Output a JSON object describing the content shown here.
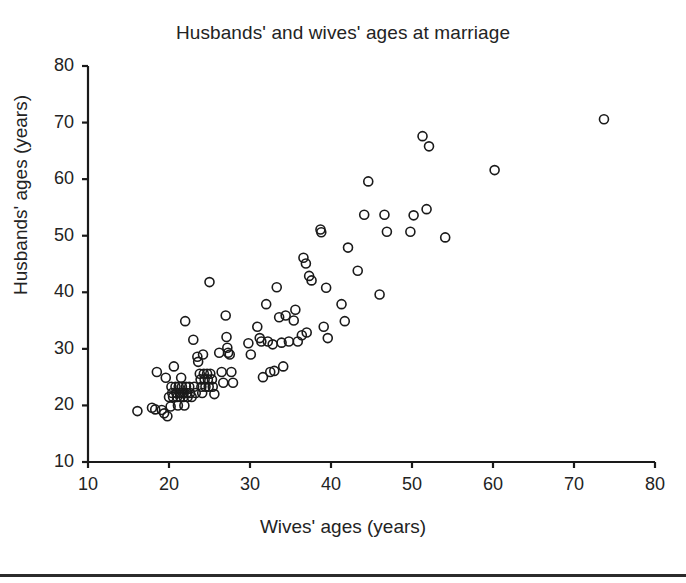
{
  "figure": {
    "title": "Husbands' and wives' ages at marriage",
    "background_color": "#ffffff",
    "axis_color": "#1a1a1a",
    "marker_color": "#1a1a1a",
    "bottom_rule_color": "#2b2b2b"
  },
  "axes": {
    "x_label": "Wives' ages (years)",
    "y_label": "Husbands' ages (years)",
    "x_ticks": [
      "10",
      "20",
      "30",
      "40",
      "50",
      "60",
      "70",
      "80"
    ],
    "y_ticks": [
      "10",
      "20",
      "30",
      "40",
      "50",
      "60",
      "70",
      "80"
    ]
  },
  "chart_data": {
    "type": "scatter",
    "title": "Husbands' and wives' ages at marriage",
    "xlabel": "Wives' ages (years)",
    "ylabel": "Husbands' ages (years)",
    "xlim": [
      10,
      80
    ],
    "ylim": [
      10,
      80
    ],
    "xticks": [
      10,
      20,
      30,
      40,
      50,
      60,
      70,
      80
    ],
    "yticks": [
      10,
      20,
      30,
      40,
      50,
      60,
      70,
      80
    ],
    "grid": false,
    "legend": null,
    "marker": "open-circle",
    "marker_size_px": 9,
    "n_points": 115,
    "series": [
      {
        "name": "couples",
        "points": [
          [
            16.1,
            19.0
          ],
          [
            17.9,
            19.6
          ],
          [
            18.3,
            19.3
          ],
          [
            18.5,
            25.9
          ],
          [
            19.1,
            19.2
          ],
          [
            19.4,
            18.6
          ],
          [
            19.6,
            24.9
          ],
          [
            19.8,
            18.1
          ],
          [
            20.0,
            21.5
          ],
          [
            20.2,
            19.8
          ],
          [
            20.3,
            23.3
          ],
          [
            20.4,
            22.2
          ],
          [
            20.5,
            21.5
          ],
          [
            20.6,
            26.9
          ],
          [
            20.8,
            23.3
          ],
          [
            20.9,
            22.2
          ],
          [
            21.0,
            21.5
          ],
          [
            21.1,
            20.0
          ],
          [
            21.2,
            23.3
          ],
          [
            21.3,
            22.2
          ],
          [
            21.4,
            21.5
          ],
          [
            21.5,
            24.9
          ],
          [
            21.6,
            23.3
          ],
          [
            21.7,
            22.2
          ],
          [
            21.8,
            21.5
          ],
          [
            21.9,
            20.0
          ],
          [
            22.0,
            34.9
          ],
          [
            22.1,
            23.3
          ],
          [
            22.2,
            22.2
          ],
          [
            22.3,
            21.5
          ],
          [
            22.5,
            23.3
          ],
          [
            22.6,
            22.2
          ],
          [
            22.8,
            21.5
          ],
          [
            23.0,
            31.6
          ],
          [
            23.1,
            23.3
          ],
          [
            23.3,
            22.2
          ],
          [
            23.5,
            28.6
          ],
          [
            23.6,
            27.7
          ],
          [
            23.8,
            25.6
          ],
          [
            23.9,
            24.6
          ],
          [
            24.0,
            23.3
          ],
          [
            24.1,
            22.2
          ],
          [
            24.2,
            29.0
          ],
          [
            24.3,
            25.6
          ],
          [
            24.4,
            24.6
          ],
          [
            24.5,
            23.3
          ],
          [
            24.7,
            25.6
          ],
          [
            24.8,
            24.6
          ],
          [
            24.9,
            23.3
          ],
          [
            25.0,
            41.8
          ],
          [
            25.1,
            25.6
          ],
          [
            25.3,
            24.6
          ],
          [
            25.4,
            23.3
          ],
          [
            25.6,
            22.0
          ],
          [
            26.2,
            29.3
          ],
          [
            26.5,
            25.9
          ],
          [
            26.7,
            24.0
          ],
          [
            27.0,
            35.9
          ],
          [
            27.1,
            32.1
          ],
          [
            27.2,
            30.2
          ],
          [
            27.3,
            29.3
          ],
          [
            27.5,
            29.0
          ],
          [
            27.7,
            25.9
          ],
          [
            27.9,
            24.0
          ],
          [
            29.8,
            31.0
          ],
          [
            30.1,
            29.0
          ],
          [
            30.9,
            33.9
          ],
          [
            31.2,
            31.9
          ],
          [
            31.4,
            31.3
          ],
          [
            31.6,
            25.0
          ],
          [
            32.0,
            37.9
          ],
          [
            32.2,
            31.3
          ],
          [
            32.5,
            25.9
          ],
          [
            32.8,
            30.8
          ],
          [
            33.0,
            26.1
          ],
          [
            33.3,
            40.9
          ],
          [
            33.6,
            35.6
          ],
          [
            33.9,
            31.1
          ],
          [
            34.1,
            26.9
          ],
          [
            34.4,
            35.9
          ],
          [
            34.8,
            31.3
          ],
          [
            35.4,
            35.0
          ],
          [
            35.6,
            36.9
          ],
          [
            35.9,
            31.3
          ],
          [
            36.4,
            32.4
          ],
          [
            36.6,
            46.1
          ],
          [
            36.9,
            45.1
          ],
          [
            37.0,
            32.9
          ],
          [
            37.3,
            42.9
          ],
          [
            37.6,
            42.1
          ],
          [
            38.7,
            51.1
          ],
          [
            38.8,
            50.6
          ],
          [
            39.1,
            33.9
          ],
          [
            39.4,
            40.8
          ],
          [
            39.6,
            31.9
          ],
          [
            41.3,
            37.9
          ],
          [
            41.7,
            34.9
          ],
          [
            42.1,
            47.9
          ],
          [
            43.3,
            43.8
          ],
          [
            44.1,
            53.7
          ],
          [
            44.6,
            59.6
          ],
          [
            46.0,
            39.6
          ],
          [
            46.6,
            53.7
          ],
          [
            46.9,
            50.7
          ],
          [
            49.8,
            50.7
          ],
          [
            50.2,
            53.6
          ],
          [
            51.3,
            67.6
          ],
          [
            51.8,
            54.7
          ],
          [
            52.1,
            65.8
          ],
          [
            54.1,
            49.7
          ],
          [
            60.2,
            61.6
          ],
          [
            73.7,
            70.6
          ]
        ]
      }
    ]
  }
}
